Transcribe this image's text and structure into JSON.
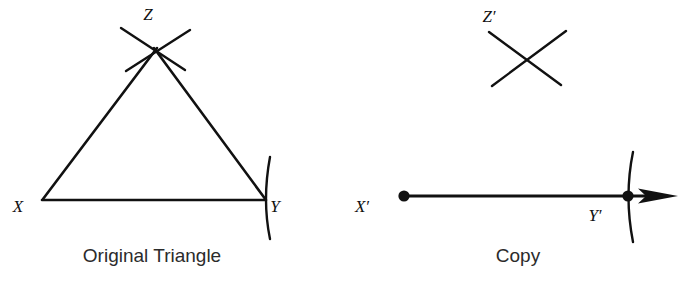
{
  "figure": {
    "background_color": "#ffffff",
    "ink_color": "#111111",
    "width": 689,
    "height": 283
  },
  "panels": [
    {
      "id": "original",
      "caption": "Original Triangle",
      "caption_x": 152,
      "caption_y": 262,
      "vertices": [
        {
          "name": "X",
          "label": "X",
          "label_x": 18,
          "label_y": 212,
          "x": 42,
          "y": 200,
          "dot": false
        },
        {
          "name": "Y",
          "label": "Y",
          "label_x": 275,
          "label_y": 212,
          "x": 265,
          "y": 200,
          "dot": false
        },
        {
          "name": "Z",
          "label": "Z",
          "label_x": 148,
          "label_y": 20,
          "x": 155,
          "y": 48,
          "dot": false
        }
      ]
    },
    {
      "id": "copy",
      "caption": "Copy",
      "caption_x": 518,
      "caption_y": 262,
      "vertices": [
        {
          "name": "X-prime",
          "label": "X′",
          "label_x": 362,
          "label_y": 212,
          "x": 404,
          "y": 196,
          "dot": true
        },
        {
          "name": "Y-prime",
          "label": "Y′",
          "label_x": 595,
          "label_y": 221,
          "x": 628,
          "y": 196,
          "dot": true
        },
        {
          "name": "Z-prime",
          "label": "Z′",
          "label_x": 489,
          "label_y": 22,
          "x": 525,
          "y": 45,
          "dot": false
        }
      ]
    }
  ],
  "captions": {
    "original": "Original Triangle",
    "copy": "Copy"
  },
  "labels": {
    "x": "X",
    "y": "Y",
    "z": "Z",
    "x_prime": "X′",
    "y_prime": "Y′",
    "z_prime": "Z′"
  },
  "geometry": {
    "original_triangle": {
      "side_xy": "M 42 200 L 265 200",
      "side_xz": "M 43 199 L 157 48",
      "side_zy": "M 154 48 L 266 200"
    },
    "original_arcs": {
      "apex_arc_left": "M 121 28 L 185 70",
      "apex_arc_right": "M 190 30 L 126 71",
      "vertex_y_arc": "M 270 157 Q 262 200 270 239"
    },
    "copy_segment": {
      "line": "M 404 196 L 660 196",
      "arrow_tip_x": 678,
      "arrow_tip_y": 196
    },
    "copy_arcs": {
      "cross_left": "M 489 32 L 561 85",
      "cross_right": "M 566 31 L 492 86",
      "vertex_y_arc": "M 633 152 Q 624 196 633 242"
    },
    "dot_radius": 5.6
  }
}
